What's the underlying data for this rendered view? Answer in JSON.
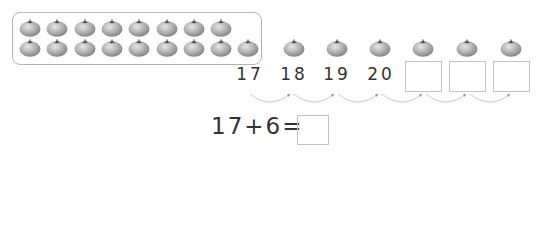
{
  "frame": {
    "row1_count": 8,
    "row2_count": 9,
    "label": "17 tomatoes grouped"
  },
  "number_line": {
    "labels": [
      "17",
      "18",
      "19",
      "20"
    ],
    "empty_boxes": 3,
    "hops": 6
  },
  "equation": {
    "text": "17+6=",
    "answer": ""
  },
  "colors": {
    "tomato": "#a9a9a9",
    "stem": "#555555",
    "border": "#b4b4b4"
  }
}
